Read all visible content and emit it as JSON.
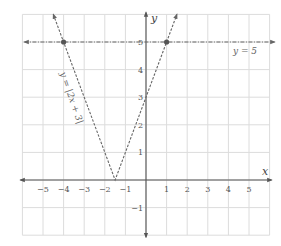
{
  "chart_data": {
    "type": "line",
    "title": "",
    "xlabel": "x",
    "ylabel": "y",
    "xlim": [
      -6,
      6
    ],
    "ylim": [
      -2,
      6
    ],
    "grid": true,
    "x_ticks": [
      "−5",
      "−4",
      "−3",
      "−2",
      "−1",
      "1",
      "2",
      "3",
      "4",
      "5"
    ],
    "x_tick_values": [
      -5,
      -4,
      -3,
      -2,
      -1,
      1,
      2,
      3,
      4,
      5
    ],
    "y_ticks": [
      "5",
      "4",
      "3",
      "2",
      "1",
      "−1"
    ],
    "y_tick_values": [
      5,
      4,
      3,
      2,
      1,
      -1
    ],
    "series": [
      {
        "name": "y = |2x + 3|",
        "style": "dashed",
        "x": [
          -4.5,
          -4,
          -1.5,
          1,
          1.5
        ],
        "y": [
          6,
          5,
          0,
          5,
          6
        ]
      },
      {
        "name": "y = 5",
        "style": "dashed",
        "x": [
          -6,
          6
        ],
        "y": [
          5,
          5
        ]
      }
    ],
    "points": [
      {
        "x": -4,
        "y": 5,
        "label": ""
      },
      {
        "x": 1,
        "y": 5,
        "label": ""
      }
    ],
    "annotations": [
      {
        "text": "y = |2x + 3|",
        "position": "along left branch"
      },
      {
        "text": "y = 5",
        "position": "right, below line"
      }
    ]
  },
  "labels": {
    "x_axis": "x",
    "y_axis": "y",
    "abs_eq": "y = |2x + 3|",
    "const_eq": "y = 5"
  },
  "colors": {
    "grid": "#dcdcdc",
    "axis": "#555555",
    "curve": "#666666",
    "point": "#555555"
  }
}
